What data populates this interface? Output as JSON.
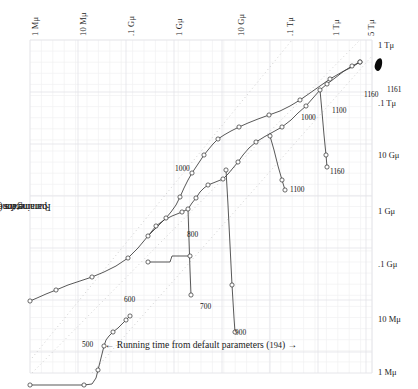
{
  "figure": {
    "background": "#ffffff",
    "grid_minor_color": "#f0f0f2",
    "grid_major_color": "#e3e3e8",
    "diagonal_color": "#c9c9c9",
    "curve_color": "#3a3a3a",
    "marker_fill": "#ffffff",
    "blob_color": "#0a0a0a"
  },
  "axes": {
    "x_title_prefix": "←",
    "x_title": "Running time from default parameters (",
    "x_title_count": "194",
    "x_title_suffix": ") →",
    "y_title_prefix": "←",
    "y_title_a": "Running time from ",
    "y_title_em": "erdos",
    "y_title_b": " parameters (•) →",
    "top_ticks": [
      {
        "label": "1 Mμ",
        "x": 30
      },
      {
        "label": "10 Mμ",
        "x": 78
      },
      {
        "label": ".1 Gμ",
        "x": 126
      },
      {
        "label": "1 Gμ",
        "x": 174
      },
      {
        "label": "10 Gμ",
        "x": 236
      },
      {
        "label": ".1 Tμ",
        "x": 285
      },
      {
        "label": "1 Tμ",
        "x": 331
      },
      {
        "label": "5 Tμ",
        "x": 366
      }
    ],
    "right_ticks": [
      {
        "label": "1 Tμ",
        "y": 45
      },
      {
        "label": ".1 Tμ",
        "y": 103
      },
      {
        "label": "10 Gμ",
        "y": 155
      },
      {
        "label": "1 Gμ",
        "y": 211
      },
      {
        "label": ".1 Gμ",
        "y": 264
      },
      {
        "label": "10 Mμ",
        "y": 319
      },
      {
        "label": "1 Mμ",
        "y": 372
      }
    ]
  },
  "point_labels": [
    {
      "text": "400",
      "x": 68,
      "y": 367
    },
    {
      "text": "500",
      "x": 52,
      "y": 300
    },
    {
      "text": "600",
      "x": 94,
      "y": 255
    },
    {
      "text": "700",
      "x": 170,
      "y": 262
    },
    {
      "text": "800",
      "x": 157,
      "y": 190
    },
    {
      "text": "900",
      "x": 205,
      "y": 288
    },
    {
      "text": "1000",
      "x": 145,
      "y": 124
    },
    {
      "text": "1000",
      "x": 271,
      "y": 73
    },
    {
      "text": "1100",
      "x": 260,
      "y": 145
    },
    {
      "text": "1100",
      "x": 302,
      "y": 66
    },
    {
      "text": "1160",
      "x": 300,
      "y": 127
    },
    {
      "text": "1160",
      "x": 334,
      "y": 50
    },
    {
      "text": "1161",
      "x": 357,
      "y": 45
    }
  ],
  "chart_data": {
    "type": "line",
    "title": "",
    "xlabel": "← Running time from default parameters (194) →",
    "ylabel": "← Running time from erdos parameters (•) →",
    "xscale": "log",
    "yscale": "log",
    "xlim": [
      "1 Mμ",
      "5 Tμ"
    ],
    "ylim": [
      "1 Mμ",
      "1 Tμ"
    ],
    "x_tick_labels": [
      "1 Mμ",
      "10 Mμ",
      ".1 Gμ",
      "1 Gμ",
      "10 Gμ",
      ".1 Tμ",
      "1 Tμ",
      "5 Tμ"
    ],
    "y_tick_labels": [
      "1 Tμ",
      ".1 Tμ",
      "10 Gμ",
      "1 Gμ",
      ".1 Gμ",
      "10 Mμ",
      "1 Mμ"
    ],
    "grid": true,
    "legend": "none",
    "annotations": [
      "400",
      "500",
      "600",
      "700",
      "800",
      "900",
      "1000",
      "1000",
      "1100",
      "1100",
      "1160",
      "1160",
      "1161"
    ],
    "reference_lines": [
      {
        "name": "upper-diagonal",
        "style": "dotted",
        "x1": 2,
        "y1": 318,
        "x2": 262,
        "y2": 0
      },
      {
        "name": "center-diagonal",
        "style": "dotted",
        "x1": 2,
        "y1": 333,
        "x2": 330,
        "y2": 0
      },
      {
        "name": "lower-diagonal",
        "style": "dotted",
        "x1": 62,
        "y1": 333,
        "x2": 342,
        "y2": 16
      }
    ],
    "series": [
      {
        "name": "upper-branch",
        "points": [
          [
            0,
            261
          ],
          [
            7,
            258
          ],
          [
            16,
            254
          ],
          [
            26,
            250
          ],
          [
            38,
            245
          ],
          [
            50,
            241
          ],
          [
            62,
            237
          ],
          [
            74,
            232
          ],
          [
            86,
            226
          ],
          [
            98,
            218
          ],
          [
            108,
            208
          ],
          [
            118,
            196
          ],
          [
            126,
            186
          ],
          [
            134,
            180
          ],
          [
            142,
            176
          ],
          [
            152,
            172
          ],
          [
            158,
            169
          ],
          [
            162,
            163
          ],
          [
            166,
            158
          ],
          [
            170,
            152
          ],
          [
            174,
            148
          ],
          [
            178,
            145
          ],
          [
            183,
            143
          ],
          [
            188,
            141
          ],
          [
            193,
            139
          ],
          [
            198,
            134
          ],
          [
            203,
            128
          ],
          [
            208,
            122
          ],
          [
            213,
            115
          ],
          [
            219,
            108
          ],
          [
            226,
            102
          ],
          [
            234,
            97
          ],
          [
            243,
            92
          ],
          [
            252,
            87
          ],
          [
            261,
            80
          ],
          [
            268,
            73
          ],
          [
            276,
            66
          ],
          [
            283,
            58
          ],
          [
            290,
            50
          ],
          [
            297,
            44
          ],
          [
            305,
            38
          ],
          [
            314,
            31
          ],
          [
            322,
            26
          ],
          [
            330,
            22
          ]
        ]
      },
      {
        "name": "mid-branch",
        "points": [
          [
            118,
            196
          ],
          [
            124,
            190
          ],
          [
            130,
            184
          ],
          [
            136,
            178
          ],
          [
            141,
            172
          ],
          [
            146,
            165
          ],
          [
            150,
            157
          ],
          [
            154,
            148
          ],
          [
            158,
            140
          ],
          [
            162,
            133
          ],
          [
            166,
            127
          ],
          [
            170,
            121
          ],
          [
            174,
            115
          ],
          [
            178,
            110
          ],
          [
            183,
            104
          ],
          [
            188,
            99
          ],
          [
            194,
            95
          ],
          [
            201,
            91
          ],
          [
            209,
            87
          ],
          [
            218,
            83
          ],
          [
            228,
            79
          ],
          [
            239,
            75
          ],
          [
            250,
            71
          ],
          [
            260,
            66
          ],
          [
            270,
            60
          ],
          [
            280,
            53
          ],
          [
            290,
            46
          ],
          [
            300,
            39
          ],
          [
            312,
            32
          ],
          [
            322,
            27
          ],
          [
            330,
            22
          ]
        ]
      },
      {
        "name": "lower-tail-400",
        "points": [
          [
            0,
            345
          ],
          [
            18,
            345
          ],
          [
            36,
            345
          ],
          [
            54,
            345
          ],
          [
            62,
            344
          ],
          [
            66,
            338
          ],
          [
            68,
            330
          ],
          [
            70,
            322
          ],
          [
            72,
            314
          ],
          [
            74,
            306
          ],
          [
            76,
            300
          ],
          [
            79,
            296
          ],
          [
            83,
            292
          ],
          [
            88,
            288
          ],
          [
            92,
            284
          ],
          [
            96,
            280
          ],
          [
            100,
            276
          ]
        ]
      },
      {
        "name": "700-drop",
        "points": [
          [
            158,
            169
          ],
          [
            159,
            200
          ],
          [
            160,
            230
          ],
          [
            161,
            255
          ]
        ]
      },
      {
        "name": "900-drop",
        "points": [
          [
            196,
            130
          ],
          [
            198,
            165
          ],
          [
            200,
            205
          ],
          [
            202,
            245
          ],
          [
            204,
            278
          ],
          [
            205,
            292
          ]
        ]
      },
      {
        "name": "1100-drop",
        "points": [
          [
            240,
            96
          ],
          [
            244,
            110
          ],
          [
            248,
            126
          ],
          [
            252,
            140
          ],
          [
            255,
            150
          ]
        ]
      },
      {
        "name": "1160-drop",
        "points": [
          [
            290,
            50
          ],
          [
            292,
            72
          ],
          [
            294,
            95
          ],
          [
            296,
            115
          ],
          [
            297,
            127
          ]
        ]
      },
      {
        "name": "step-700-plateau",
        "points": [
          [
            118,
            222
          ],
          [
            140,
            222
          ],
          [
            142,
            216
          ],
          [
            160,
            216
          ]
        ]
      }
    ],
    "dense_cluster": {
      "name": "1161",
      "x": 345,
      "y": 22,
      "shape": "filled-blob"
    }
  }
}
